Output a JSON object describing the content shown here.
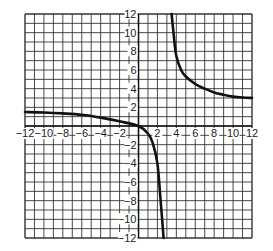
{
  "chart_data": {
    "type": "line",
    "title": "",
    "xlabel": "",
    "ylabel": "",
    "xlim": [
      -12,
      12
    ],
    "ylim": [
      -12,
      12
    ],
    "grid": true,
    "grid_step": 1,
    "x_ticks": [
      -12,
      -10,
      -8,
      -6,
      -4,
      -2,
      2,
      4,
      6,
      8,
      10,
      12
    ],
    "y_ticks": [
      12,
      10,
      8,
      6,
      4,
      2,
      -2,
      -4,
      -6,
      -8,
      -10,
      -12
    ],
    "x_tick_labels": [
      "−12",
      "−10",
      "−8",
      "−6",
      "−4",
      "−2",
      "2",
      "4",
      "6",
      "8",
      "10",
      "12"
    ],
    "y_tick_labels": [
      "12",
      "10",
      "8",
      "6",
      "4",
      "2",
      "−2",
      "−4",
      "−6",
      "−8",
      "−10",
      "−12"
    ],
    "series": [
      {
        "name": "left-branch",
        "points": [
          [
            -12,
            1.5
          ],
          [
            -10,
            1.45
          ],
          [
            -8,
            1.35
          ],
          [
            -6,
            1.2
          ],
          [
            -4,
            0.9
          ],
          [
            -2,
            0.5
          ],
          [
            0,
            0
          ],
          [
            1,
            -0.8
          ],
          [
            1.5,
            -1.8
          ],
          [
            2,
            -4
          ],
          [
            2.3,
            -7.5
          ],
          [
            2.5,
            -10
          ],
          [
            2.65,
            -12
          ]
        ]
      },
      {
        "name": "right-branch",
        "points": [
          [
            3.5,
            12
          ],
          [
            3.8,
            9
          ],
          [
            4,
            7.5
          ],
          [
            4.5,
            6
          ],
          [
            5,
            5.3
          ],
          [
            6,
            4.5
          ],
          [
            7,
            4
          ],
          [
            8,
            3.6
          ],
          [
            9,
            3.35
          ],
          [
            10,
            3.15
          ],
          [
            11,
            3.05
          ],
          [
            12,
            3.0
          ]
        ]
      }
    ],
    "colors": {
      "grid": "#333333",
      "curve": "#111111",
      "background": "#ffffff"
    }
  }
}
